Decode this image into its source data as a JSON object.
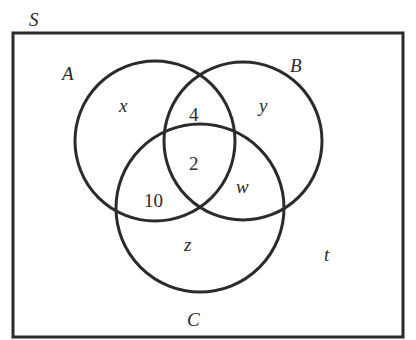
{
  "diagram": {
    "type": "venn-diagram",
    "universal_set": {
      "label": "S"
    },
    "sets": [
      {
        "name": "A",
        "label": "A"
      },
      {
        "name": "B",
        "label": "B"
      },
      {
        "name": "C",
        "label": "C"
      }
    ],
    "regions": {
      "only_A": "x",
      "only_B": "y",
      "only_C": "z",
      "A_and_B_only": "4",
      "A_and_B_and_C": "2",
      "A_and_C_only": "10",
      "B_and_C_only": "w",
      "outside_all": "t"
    },
    "colors": {
      "stroke": "#2b2b2b",
      "background": "#ffffff"
    }
  }
}
